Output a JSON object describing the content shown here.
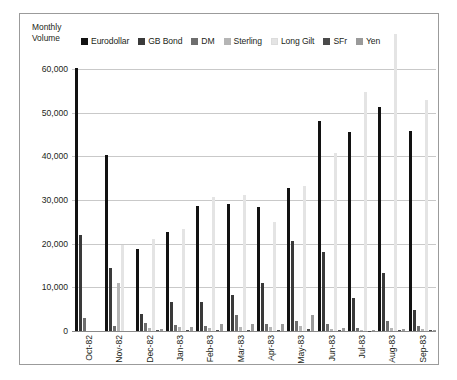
{
  "chart_data": {
    "type": "bar",
    "title": "",
    "axis_title": "Monthly\nVolume",
    "ylabel": "Monthly Volume",
    "xlabel": "",
    "ylim": [
      0,
      60000
    ],
    "yticks": [
      0,
      10000,
      20000,
      30000,
      40000,
      50000,
      60000
    ],
    "ytick_labels": [
      "0",
      "10,000",
      "20,000",
      "30,000",
      "40,000",
      "50,000",
      "60,000"
    ],
    "grid": true,
    "legend_position": "top",
    "categories": [
      "Oct-82",
      "Nov-82",
      "Dec-82",
      "Jan-83",
      "Feb-83",
      "Mar-83",
      "Apr-83",
      "May-83",
      "Jun-83",
      "Jul-83",
      "Aug-83",
      "Sep-83"
    ],
    "series": [
      {
        "name": "Eurodollar",
        "color": "#121212",
        "values": [
          60300,
          40300,
          18700,
          22600,
          28700,
          29000,
          28400,
          32700,
          48200,
          45600,
          51300,
          45800
        ]
      },
      {
        "name": "GB Bond",
        "color": "#3a3a3a",
        "values": [
          22100,
          14400,
          4000,
          6600,
          6700,
          8300,
          10900,
          20700,
          18000,
          7500,
          13400,
          4900
        ]
      },
      {
        "name": "DM",
        "color": "#6e6e6e",
        "values": [
          2900,
          1200,
          1800,
          1400,
          1100,
          3700,
          1500,
          2300,
          1600,
          700,
          2200,
          1100
        ]
      },
      {
        "name": "Sterling",
        "color": "#b5b5b5",
        "values": [
          0,
          11000,
          700,
          900,
          700,
          1000,
          900,
          1100,
          500,
          300,
          600,
          400
        ]
      },
      {
        "name": "Long Gilt",
        "color": "#e4e4e4",
        "values": [
          0,
          19700,
          21000,
          23400,
          30800,
          31100,
          24900,
          33200,
          40800,
          54800,
          68000,
          53000
        ]
      },
      {
        "name": "SFr",
        "color": "#4a4a4a",
        "values": [
          0,
          0,
          200,
          200,
          300,
          200,
          200,
          400,
          200,
          100,
          300,
          200
        ]
      },
      {
        "name": "Yen",
        "color": "#9a9a9a",
        "values": [
          0,
          0,
          400,
          1000,
          1600,
          1500,
          1500,
          3700,
          700,
          300,
          500,
          300
        ]
      }
    ]
  },
  "legend": {
    "items": [
      {
        "label": "Eurodollar",
        "color": "#121212"
      },
      {
        "label": "GB Bond",
        "color": "#3a3a3a"
      },
      {
        "label": "DM",
        "color": "#6e6e6e"
      },
      {
        "label": "Sterling",
        "color": "#b5b5b5"
      },
      {
        "label": "Long Gilt",
        "color": "#e4e4e4"
      },
      {
        "label": "SFr",
        "color": "#4a4a4a"
      },
      {
        "label": "Yen",
        "color": "#9a9a9a"
      }
    ]
  }
}
